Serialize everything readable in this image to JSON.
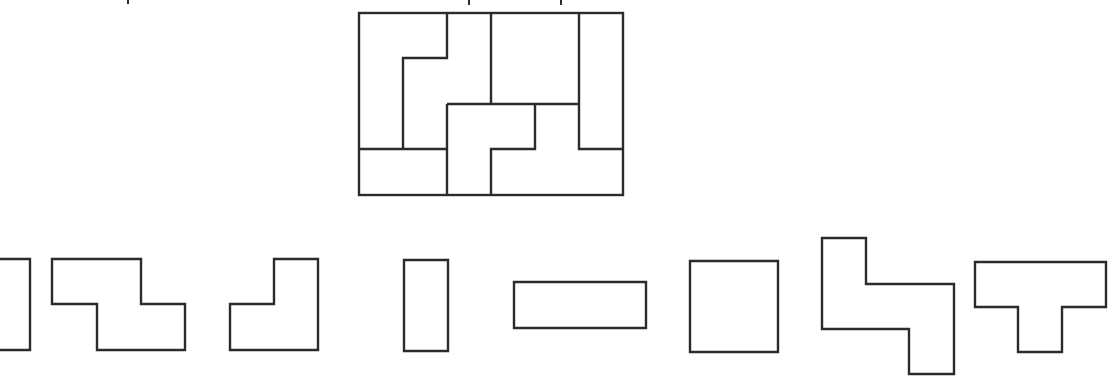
{
  "figure": {
    "cropped_top_text_descender_x": [
      128,
      469,
      561
    ],
    "target_grid": {
      "origin": [
        359,
        13
      ],
      "cell_w": 44,
      "cell_h": 45.5,
      "cols": 6,
      "rows": 4
    },
    "bottom_pieces": [
      {
        "id": "piece-1",
        "shape": "rectangle-partial",
        "note": "cut off at left edge"
      },
      {
        "id": "piece-2",
        "shape": "Z"
      },
      {
        "id": "piece-3",
        "shape": "L"
      },
      {
        "id": "piece-4",
        "shape": "vertical-domino"
      },
      {
        "id": "piece-5",
        "shape": "horizontal-tromino"
      },
      {
        "id": "piece-6",
        "shape": "square-2x2"
      },
      {
        "id": "piece-7",
        "shape": "S-tall"
      },
      {
        "id": "piece-8",
        "shape": "T"
      }
    ],
    "colors": {
      "stroke": "#2b2b2b",
      "background": "#ffffff"
    }
  }
}
